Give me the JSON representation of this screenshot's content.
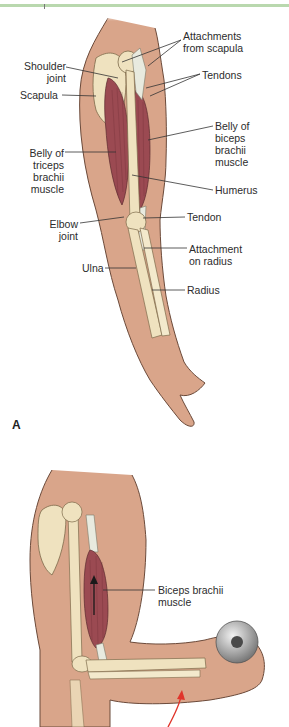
{
  "figure": {
    "panel_a": {
      "letter": "A",
      "labels": {
        "attachments_from_scapula": "Attachments\nfrom scapula",
        "shoulder_joint": "Shoulder\njoint",
        "tendons": "Tendons",
        "scapula": "Scapula",
        "belly_of_biceps": "Belly of\nbiceps\nbrachii\nmuscle",
        "belly_of_triceps": "Belly of\ntriceps\nbrachii\nmuscle",
        "humerus": "Humerus",
        "tendon": "Tendon",
        "elbow_joint": "Elbow\njoint",
        "attachment_on_radius": "Attachment\non radius",
        "ulna": "Ulna",
        "radius": "Radius"
      }
    },
    "panel_b": {
      "labels": {
        "biceps_brachii_muscle": "Biceps brachii\nmuscle"
      }
    },
    "colors": {
      "skin": "#d9a58a",
      "skin_outline": "#6b4a3a",
      "bone": "#efe2bf",
      "muscle": "#9b4a52",
      "tendon": "#e8eadf",
      "header_bar": "#b9d8ae",
      "motion_arrow": "#e0352b",
      "dumbbell": "#a9a9a9"
    }
  }
}
